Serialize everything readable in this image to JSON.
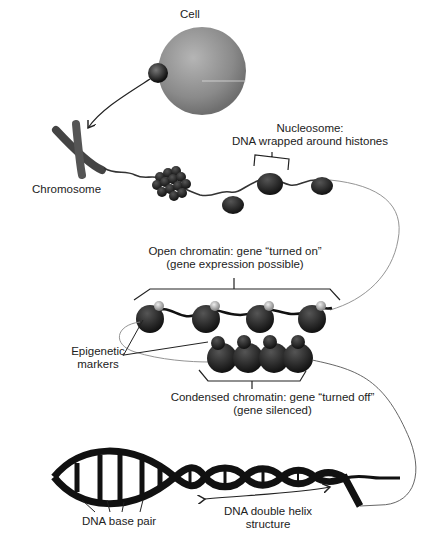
{
  "labels": {
    "cell": "Cell",
    "chromosome": "Chromosome",
    "nucleosome_line1": "Nucleosome:",
    "nucleosome_line2": "DNA wrapped around histones",
    "open_line1": "Open chromatin: gene “turned on”",
    "open_line2": "(gene expression possible)",
    "epigenetic_line1": "Epigenetic",
    "epigenetic_line2": "markers",
    "condensed_line1": "Condensed chromatin: gene “turned off”",
    "condensed_line2": "(gene silenced)",
    "base_pair": "DNA base pair",
    "helix_line1": "DNA double helix",
    "helix_line2": "structure"
  },
  "colors": {
    "cell": "#8a8a8a",
    "histone": "#1e1e1e",
    "dna": "#111111",
    "marker": "#bbbbbb",
    "text": "#222222"
  }
}
